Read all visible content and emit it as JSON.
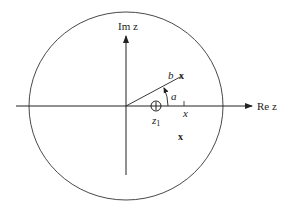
{
  "diagram": {
    "axes": {
      "real_label": "Re z",
      "imag_label": "Im z"
    },
    "labels": {
      "b": "b",
      "a": "a",
      "z1": "z",
      "z1_sub": "1",
      "x_tick": "x"
    },
    "markers": {
      "pole_upper": "x",
      "pole_lower": "x"
    },
    "colors": {
      "stroke": "#222222",
      "background": "#ffffff"
    }
  }
}
